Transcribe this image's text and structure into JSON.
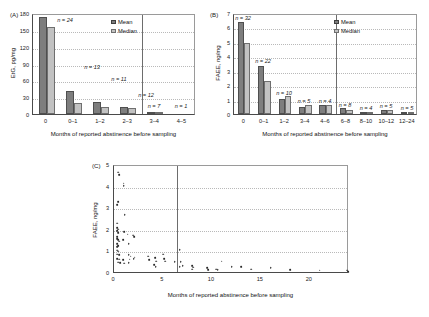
{
  "figure": {
    "caption_label_a": "(A)",
    "caption_label_b": "(B)",
    "caption_label_c": "(C)",
    "shared_xlabel": "Months of reported abstinence before sampling",
    "legend": {
      "mean": "Mean",
      "median": "Median"
    },
    "colors": {
      "mean_bar": "#7e7e7e",
      "median_bar": "#c2c2c2",
      "axis": "#4a4a4a",
      "grid": "#b9b9b9"
    }
  },
  "chart_data": [
    {
      "type": "bar",
      "panel": "(A)",
      "title": "",
      "xlabel": "Months of reported abstinence before sampling",
      "ylabel": "EtG, pg/mg",
      "ylim": [
        0,
        180
      ],
      "yticks": [
        0,
        30,
        60,
        90,
        120,
        150,
        180
      ],
      "ytick_labels": [
        "0",
        "30",
        "60",
        "90",
        "120",
        "150",
        "180"
      ],
      "categories": [
        "0",
        "0–1",
        "1–2",
        "2–3",
        "3–4",
        "4–5"
      ],
      "grid": true,
      "legend_position": "top-right",
      "divider_after_category": "2–3",
      "series": [
        {
          "name": "Mean",
          "values": [
            172,
            41,
            21,
            12.5,
            2.2,
            0
          ]
        },
        {
          "name": "Median",
          "values": [
            155,
            20.5,
            12,
            11,
            0.6,
            0
          ]
        }
      ],
      "annotations": [
        {
          "category": "0",
          "text": "n = 24",
          "n": 24
        },
        {
          "category": "0–1",
          "text": "n = 13",
          "n": 13
        },
        {
          "category": "1–2",
          "text": "n = 11",
          "n": 11
        },
        {
          "category": "2–3",
          "text": "n = 12",
          "n": 12
        },
        {
          "category": "3–4",
          "text": "n = 7",
          "n": 7
        },
        {
          "category": "4–5",
          "text": "n = 1",
          "n": 1
        }
      ]
    },
    {
      "type": "bar",
      "panel": "(B)",
      "title": "",
      "xlabel": "Months of reported abstinence before sampling",
      "ylabel": "FAEE, ng/mg",
      "ylim": [
        0,
        7
      ],
      "yticks": [
        0,
        1,
        2,
        3,
        4,
        5,
        6,
        7
      ],
      "ytick_labels": [
        "0",
        "1",
        "2",
        "3",
        "4",
        "5",
        "6",
        "7"
      ],
      "categories": [
        "0",
        "0–1",
        "1–2",
        "3–4",
        "4–6",
        "6–8",
        "8–10",
        "10–12",
        "12–24"
      ],
      "grid": true,
      "legend_position": "top-right",
      "divider_after_category": "4–6",
      "series": [
        {
          "name": "Mean",
          "values": [
            6.35,
            3.35,
            1.05,
            0.5,
            0.6,
            0.4,
            0.05,
            0.28,
            0.05
          ]
        },
        {
          "name": "Median",
          "values": [
            4.9,
            2.3,
            1.25,
            0.65,
            0.62,
            0.3,
            0.05,
            0.28,
            0.03
          ]
        }
      ],
      "annotations": [
        {
          "category": "0",
          "text": "n = 32",
          "n": 32
        },
        {
          "category": "0–1",
          "text": "n = 22",
          "n": 22
        },
        {
          "category": "1–2",
          "text": "n = 10",
          "n": 10
        },
        {
          "category": "3–4",
          "text": "n = 5",
          "n": 5
        },
        {
          "category": "4–6",
          "text": "n = 4",
          "n": 4
        },
        {
          "category": "6–8",
          "text": "n = 8",
          "n": 8
        },
        {
          "category": "8–10",
          "text": "n = 4",
          "n": 4
        },
        {
          "category": "10–12",
          "text": "n = 5",
          "n": 5
        },
        {
          "category": "12–24",
          "text": "n = 5",
          "n": 5
        }
      ]
    },
    {
      "type": "scatter",
      "panel": "(C)",
      "title": "",
      "xlabel": "Months of reported abstinence before sampling",
      "ylabel": "FAEE, ng/mg",
      "xlim": [
        0,
        24
      ],
      "ylim": [
        0,
        5
      ],
      "xticks": [
        0,
        5,
        10,
        15,
        20
      ],
      "xtick_labels": [
        "0",
        "5",
        "10",
        "15",
        "20"
      ],
      "yticks": [
        0,
        1,
        2,
        3,
        4,
        5
      ],
      "ytick_labels": [
        "0",
        "1",
        "2",
        "3",
        "4",
        "5"
      ],
      "grid": true,
      "reference_line_x": 6.4,
      "points": [
        [
          0.45,
          4.62
        ],
        [
          0.5,
          4.5
        ],
        [
          1.0,
          4.1
        ],
        [
          1.0,
          4.0
        ],
        [
          0.4,
          3.25
        ],
        [
          0.35,
          3.1
        ],
        [
          1.1,
          2.65
        ],
        [
          0.3,
          2.25
        ],
        [
          0.35,
          2.05
        ],
        [
          0.4,
          1.98
        ],
        [
          0.3,
          1.92
        ],
        [
          0.45,
          1.8
        ],
        [
          1.05,
          1.85
        ],
        [
          1.4,
          1.75
        ],
        [
          1.95,
          1.7
        ],
        [
          2.05,
          1.62
        ],
        [
          0.3,
          1.62
        ],
        [
          0.35,
          1.55
        ],
        [
          0.4,
          1.48
        ],
        [
          0.5,
          1.42
        ],
        [
          0.9,
          1.5
        ],
        [
          1.5,
          1.3
        ],
        [
          0.35,
          1.3
        ],
        [
          0.45,
          1.22
        ],
        [
          0.3,
          1.15
        ],
        [
          0.3,
          1.0
        ],
        [
          0.4,
          0.95
        ],
        [
          6.7,
          1.02
        ],
        [
          0.35,
          0.82
        ],
        [
          0.55,
          0.8
        ],
        [
          1.5,
          0.78
        ],
        [
          1.7,
          0.72
        ],
        [
          2.1,
          0.68
        ],
        [
          3.5,
          0.72
        ],
        [
          4.2,
          0.66
        ],
        [
          5.0,
          0.82
        ],
        [
          5.1,
          0.62
        ],
        [
          0.3,
          0.6
        ],
        [
          0.5,
          0.58
        ],
        [
          0.9,
          0.55
        ],
        [
          1.6,
          0.58
        ],
        [
          2.0,
          0.6
        ],
        [
          3.6,
          0.55
        ],
        [
          4.3,
          0.5
        ],
        [
          5.2,
          0.5
        ],
        [
          6.2,
          0.46
        ],
        [
          6.8,
          0.48
        ],
        [
          0.4,
          0.45
        ],
        [
          0.6,
          0.42
        ],
        [
          1.05,
          0.4
        ],
        [
          1.5,
          0.42
        ],
        [
          4.1,
          0.32
        ],
        [
          4.25,
          0.25
        ],
        [
          6.7,
          0.25
        ],
        [
          7.0,
          0.3
        ],
        [
          8.0,
          0.3
        ],
        [
          8.1,
          0.22
        ],
        [
          8.0,
          0.12
        ],
        [
          9.5,
          0.2
        ],
        [
          9.6,
          0.1
        ],
        [
          10.4,
          0.12
        ],
        [
          10.6,
          0.1
        ],
        [
          11.0,
          0.5
        ],
        [
          12.0,
          0.25
        ],
        [
          13.0,
          0.25
        ],
        [
          14.0,
          0.12
        ],
        [
          16.0,
          0.18
        ],
        [
          18.0,
          0.1
        ],
        [
          21.0,
          0.08
        ],
        [
          23.8,
          0.08
        ],
        [
          23.9,
          0.02
        ]
      ]
    }
  ]
}
